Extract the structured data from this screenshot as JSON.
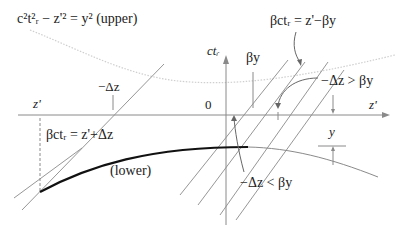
{
  "diagram": {
    "labels": {
      "upper_eq": "c²t²ᵣ − z'² = y² (upper)",
      "beta_line_eq": "βctᵣ = z'−βy",
      "ct_axis": "ctᵣ",
      "beta_y": "βy",
      "minus_dz_left": "−Δz",
      "z_prime_left": "z'",
      "origin": "0",
      "z_prime_right": "z'",
      "dz_greater": "−Δz > βy",
      "y_marker": "y",
      "lower_eq": "βctᵣ = z'+Δz",
      "lower": "(lower)",
      "dz_less": "−Δz < βy"
    },
    "colors": {
      "thin_line": "#8a8a8a",
      "thick_curve": "#111111",
      "dotted_curve": "#c8c8c8",
      "text": "#222222"
    }
  }
}
